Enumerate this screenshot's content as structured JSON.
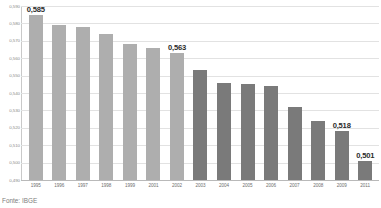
{
  "chart_data": {
    "type": "bar",
    "title": "",
    "subtitle": "",
    "xlabel": "",
    "ylabel": "",
    "ylim": [
      0.49,
      0.59
    ],
    "grid": true,
    "legend_position": "none",
    "decimal_separator": ",",
    "categories": [
      "1995",
      "1996",
      "1997",
      "1998",
      "1999",
      "2001",
      "2002",
      "2003",
      "2004",
      "2005",
      "2006",
      "2007",
      "2008",
      "2009",
      "2011"
    ],
    "values": [
      0.585,
      0.579,
      0.578,
      0.574,
      0.568,
      0.566,
      0.563,
      0.553,
      0.546,
      0.545,
      0.544,
      0.532,
      0.524,
      0.518,
      0.501
    ],
    "point_labels": [
      "0,585",
      "",
      "",
      "",
      "",
      "",
      "0,563",
      "",
      "",
      "",
      "",
      "",
      "",
      "0,518",
      "0,501"
    ],
    "ytick_labels": [
      "0,590",
      "0,580",
      "0,570",
      "0,560",
      "0,550",
      "0,540",
      "0,530",
      "0,520",
      "0,510",
      "0,500",
      "0,490"
    ],
    "ytick_values": [
      0.59,
      0.58,
      0.57,
      0.56,
      0.55,
      0.54,
      0.53,
      0.52,
      0.51,
      0.5,
      0.49
    ],
    "bar_colors": [
      "#aeaeae",
      "#aeaeae",
      "#aeaeae",
      "#aeaeae",
      "#aeaeae",
      "#aeaeae",
      "#aeaeae",
      "#7a7a7a",
      "#7a7a7a",
      "#7a7a7a",
      "#7a7a7a",
      "#7a7a7a",
      "#7a7a7a",
      "#7a7a7a",
      "#7a7a7a"
    ],
    "series": [
      {
        "name": "",
        "values": [
          0.585,
          0.579,
          0.578,
          0.574,
          0.568,
          0.566,
          0.563,
          0.553,
          0.546,
          0.545,
          0.544,
          0.532,
          0.524,
          0.518,
          0.501
        ]
      }
    ],
    "colors": {
      "bar_light": "#aeaeae",
      "bar_dark": "#7a7a7a",
      "gridline": "#e2e2e2",
      "baseline": "#b9b9b9",
      "axis": "#c9c9c9",
      "tick_text": "#8c8c8c",
      "label_text": "#2b2b2b"
    }
  },
  "source": {
    "note": "Fonte: IBGE"
  }
}
